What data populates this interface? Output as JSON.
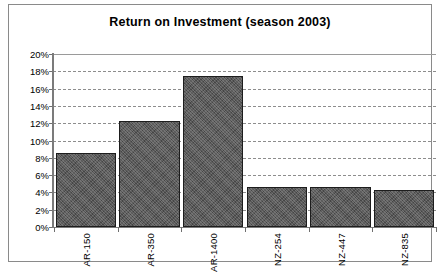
{
  "chart_data": {
    "type": "bar",
    "title": "Return on Investment (season 2003)",
    "xlabel": "",
    "ylabel": "",
    "categories": [
      "AR-150",
      "AR-350",
      "AR-1400",
      "NZ-254",
      "NZ-447",
      "NZ-835"
    ],
    "values": [
      8.6,
      12.3,
      17.5,
      4.6,
      4.6,
      4.3
    ],
    "ylim": [
      0,
      20
    ],
    "ytick_values": [
      0,
      2,
      4,
      6,
      8,
      10,
      12,
      14,
      16,
      18,
      20
    ],
    "ytick_labels": [
      "0%",
      "2%",
      "4%",
      "6%",
      "8%",
      "10%",
      "12%",
      "14%",
      "16%",
      "18%",
      "20%"
    ],
    "grid": true,
    "grid_axis": "y",
    "grid_style": "dashed",
    "legend": false,
    "legend_position": "none",
    "value_format": "percent",
    "bar_color": "#595959",
    "bar_edge_color": "#1d1d1d",
    "grid_color": "#8d8d8d",
    "axis_color": "#7b7b7b",
    "frame_color": "#8a8a8a",
    "background_color": "#ffffff",
    "text_color": "#000000",
    "xtick_label_rotation": 90
  }
}
